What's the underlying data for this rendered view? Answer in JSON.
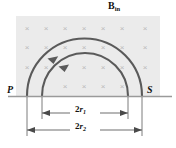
{
  "figure": {
    "kind": "physics-diagram",
    "colors": {
      "field_region_fill": "#ebebeb",
      "field_cross": "#b9b9b9",
      "arc_stroke": "#5a5a5a",
      "baseline": "#9a9a9a",
      "dimension_line": "#6e6e6e",
      "text": "#111111",
      "background": "#ffffff"
    },
    "field": {
      "label_symbol": "B",
      "label_subscript": "in",
      "label_full": "B_in",
      "cross_glyph": "×",
      "cross_rows": 4,
      "cross_cols": 7,
      "region": {
        "x": 16,
        "y": 16,
        "width": 144,
        "height": 80
      }
    },
    "points": {
      "start_label": "P",
      "end_label": "S"
    },
    "arcs": [
      {
        "name": "outer-arc",
        "from": "P",
        "to": "S",
        "radius_label": "r2",
        "cx": 84.5,
        "cy": 96,
        "r": 57.5,
        "direction": "counterclockwise"
      },
      {
        "name": "inner-arc",
        "from": "P",
        "to": "S",
        "radius_label": "r1",
        "cx": 84.5,
        "cy": 96,
        "r": 43.0,
        "direction": "counterclockwise"
      }
    ],
    "dimensions": [
      {
        "name": "inner-diameter",
        "text_prefix": "2",
        "text_var": "r",
        "text_sub": "1",
        "label": "2r1",
        "x1": 42,
        "x2": 128,
        "y": 113
      },
      {
        "name": "outer-diameter",
        "text_prefix": "2",
        "text_var": "r",
        "text_sub": "2",
        "label": "2r2",
        "x1": 27,
        "x2": 142,
        "y": 130
      }
    ],
    "baseline": {
      "y": 96,
      "x1": 8,
      "x2": 172
    }
  }
}
